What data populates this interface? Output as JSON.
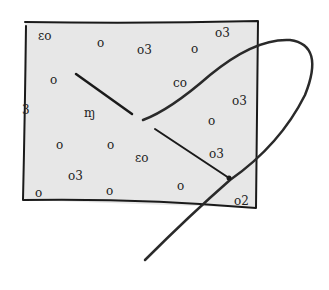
{
  "illustration": {
    "subject": "hand-drawn sketch of a speckled fabric patch pierced by a needle and thread",
    "fabric": {
      "fill": "#e6e6e6",
      "stroke": "#1a1a1a"
    },
    "thread": {
      "stroke": "#2a2a2a"
    },
    "marks": [
      {
        "text": "ɛo",
        "x": 38,
        "y": 30
      },
      {
        "text": "o",
        "x": 97,
        "y": 37
      },
      {
        "text": "o3",
        "x": 137,
        "y": 44
      },
      {
        "text": "o3",
        "x": 215,
        "y": 27
      },
      {
        "text": "o",
        "x": 191,
        "y": 43
      },
      {
        "text": "o",
        "x": 50,
        "y": 74
      },
      {
        "text": "co",
        "x": 173,
        "y": 77
      },
      {
        "text": "o3",
        "x": 232,
        "y": 95
      },
      {
        "text": "3",
        "x": 22,
        "y": 104
      },
      {
        "text": "ɱ",
        "x": 84,
        "y": 107
      },
      {
        "text": "o",
        "x": 208,
        "y": 115
      },
      {
        "text": "o",
        "x": 56,
        "y": 139
      },
      {
        "text": "o",
        "x": 107,
        "y": 139
      },
      {
        "text": "ɛo",
        "x": 135,
        "y": 152
      },
      {
        "text": "o3",
        "x": 209,
        "y": 148
      },
      {
        "text": "o3",
        "x": 68,
        "y": 170
      },
      {
        "text": "o",
        "x": 35,
        "y": 187
      },
      {
        "text": "o",
        "x": 106,
        "y": 185
      },
      {
        "text": "o",
        "x": 177,
        "y": 180
      },
      {
        "text": "o2",
        "x": 234,
        "y": 195
      }
    ]
  }
}
